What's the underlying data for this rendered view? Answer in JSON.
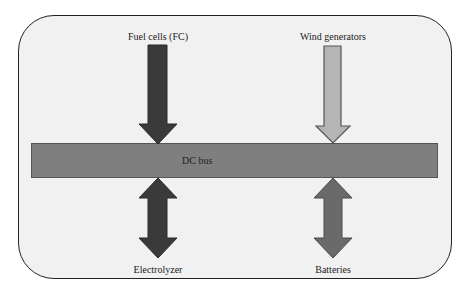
{
  "diagram": {
    "bus": {
      "label": "DC bus"
    },
    "nodes": [
      {
        "id": "fuel-cells",
        "label": "Fuel cells (FC)",
        "position": "top-left",
        "flow": "to-bus",
        "fill": "#3a3a3a"
      },
      {
        "id": "wind-generators",
        "label": "Wind generators",
        "position": "top-right",
        "flow": "to-bus",
        "fill": "#b5b5b5"
      },
      {
        "id": "electrolyzer",
        "label": "Electrolyzer",
        "position": "bottom-left",
        "flow": "bidirectional",
        "fill": "#3a3a3a"
      },
      {
        "id": "batteries",
        "label": "Batteries",
        "position": "bottom-right",
        "flow": "bidirectional",
        "fill": "#6a6a6a"
      }
    ]
  }
}
